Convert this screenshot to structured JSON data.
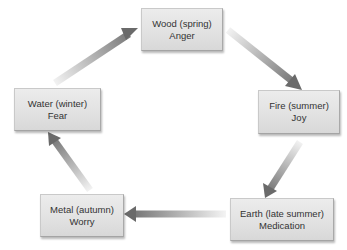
{
  "diagram": {
    "nodes": [
      {
        "id": "wood",
        "element": "Wood (spring)",
        "emotion": "Anger"
      },
      {
        "id": "fire",
        "element": "Fire (summer)",
        "emotion": "Joy"
      },
      {
        "id": "earth",
        "element": "Earth (late summer)",
        "emotion": "Medication"
      },
      {
        "id": "metal",
        "element": "Metal (autumn)",
        "emotion": "Worry"
      },
      {
        "id": "water",
        "element": "Water (winter)",
        "emotion": "Fear"
      }
    ],
    "edges": [
      {
        "from": "wood",
        "to": "fire"
      },
      {
        "from": "fire",
        "to": "earth"
      },
      {
        "from": "earth",
        "to": "metal"
      },
      {
        "from": "metal",
        "to": "water"
      },
      {
        "from": "water",
        "to": "wood"
      }
    ],
    "colors": {
      "box_top": "#ececec",
      "box_bottom": "#d8d8d8",
      "text": "#333333",
      "arrow_light": "#f0f0f0",
      "arrow_dark": "#6e6e6e"
    }
  }
}
